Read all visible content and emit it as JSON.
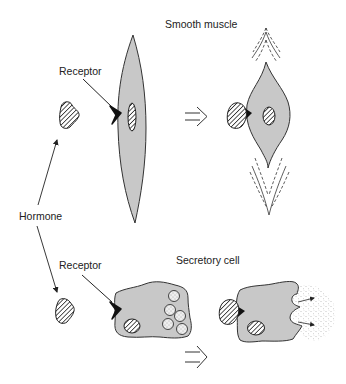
{
  "diagram": {
    "type": "biology-illustration",
    "labels": {
      "smooth_muscle": "Smooth muscle",
      "receptor_top": "Receptor",
      "hormone": "Hormone",
      "receptor_bottom": "Receptor",
      "secretory_cell": "Secretory cell"
    },
    "panels": [
      {
        "name": "smooth-muscle",
        "before": "Elongated smooth muscle cell with unbound receptor and nearby hormone",
        "after": "Hormone bound to receptor; cell contracted (shortened, widened) with motion lines"
      },
      {
        "name": "secretory-cell",
        "before": "Secretory cell with unbound receptor and secretory granules",
        "after": "Hormone bound to receptor; granules released by exocytosis"
      }
    ],
    "colors": {
      "cell_fill": "#c8c8c8",
      "outline": "#333333",
      "receptor": "#111111",
      "hatch": "#222222",
      "background": "#ffffff"
    }
  }
}
